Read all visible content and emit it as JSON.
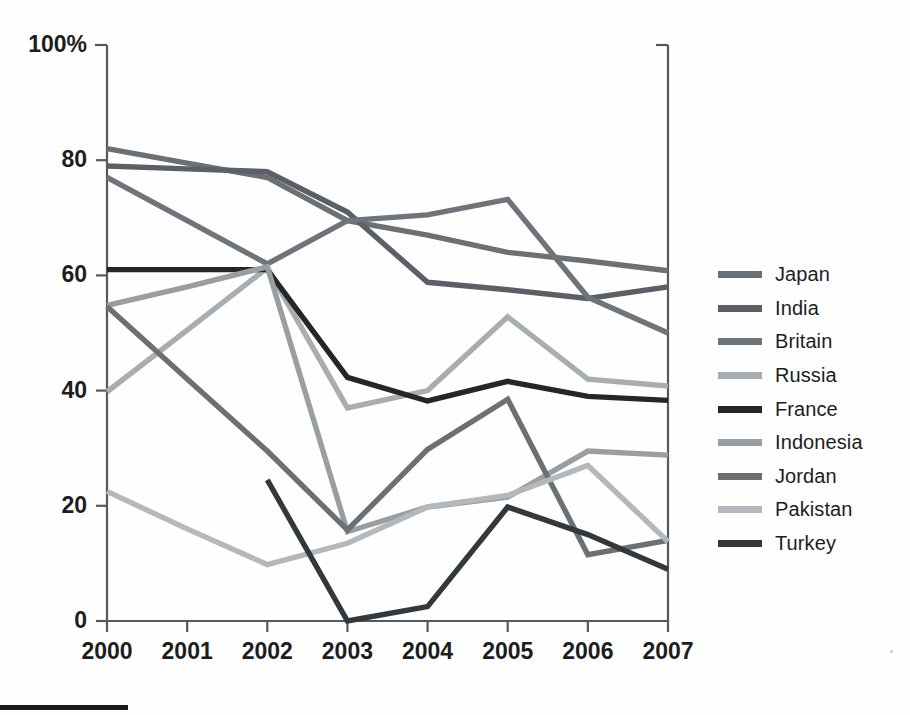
{
  "chart_data": {
    "type": "line",
    "title": "",
    "subtitle": "",
    "xlabel": "",
    "ylabel": "",
    "x": [
      "2000",
      "2001",
      "2002",
      "2003",
      "2004",
      "2005",
      "2006",
      "2007"
    ],
    "xlim": [
      2000,
      2007
    ],
    "ylim": [
      0,
      100
    ],
    "yticks": [
      0,
      20,
      40,
      60,
      80,
      100
    ],
    "ytick_labels": [
      "0",
      "20",
      "40",
      "60",
      "80",
      "100%"
    ],
    "xtick_labels": [
      "2000",
      "2001",
      "2002",
      "2003",
      "2004",
      "2005",
      "2006",
      "2007"
    ],
    "grid": false,
    "legend_position": "right",
    "series": [
      {
        "name": "Japan",
        "color": "#6b7075",
        "values": [
          82,
          79.5,
          77,
          69.5,
          67,
          64,
          62.5,
          60.8
        ]
      },
      {
        "name": "India",
        "color": "#5a6066",
        "values": [
          79,
          78.5,
          78,
          71,
          58.8,
          57.5,
          56,
          58
        ]
      },
      {
        "name": "Britain",
        "color": "#6e7479",
        "values": [
          77,
          69.5,
          62,
          69.5,
          70.5,
          73.2,
          56.2,
          50
        ]
      },
      {
        "name": "Russia",
        "color": "#a8adb1",
        "values": [
          39.8,
          50.5,
          61.3,
          37,
          40,
          52.8,
          42,
          40.8
        ]
      },
      {
        "name": "France",
        "color": "#262626",
        "values": [
          61,
          61,
          61,
          42.3,
          38.2,
          41.6,
          39,
          38.3
        ]
      },
      {
        "name": "Indonesia",
        "color": "#999ea2",
        "values": [
          54.8,
          58,
          61.5,
          15.5,
          19.8,
          21.5,
          29.5,
          28.8
        ]
      },
      {
        "name": "Jordan",
        "color": "#6b7075",
        "values": [
          54.6,
          42,
          29.5,
          15.8,
          29.8,
          38.5,
          11.5,
          14
        ]
      },
      {
        "name": "Pakistan",
        "color": "#b3b8bc",
        "values": [
          22.5,
          16,
          9.8,
          13.5,
          19.8,
          21.8,
          27,
          13.8
        ]
      },
      {
        "name": "Turkey",
        "color": "#33383c",
        "values": [
          null,
          null,
          24.5,
          0,
          2.5,
          19.8,
          15,
          9
        ]
      }
    ],
    "legend": [
      {
        "label": "Japan",
        "color": "#6b7075"
      },
      {
        "label": "India",
        "color": "#5a6066"
      },
      {
        "label": "Britain",
        "color": "#6e7479"
      },
      {
        "label": "Russia",
        "color": "#a8adb1"
      },
      {
        "label": "France",
        "color": "#262626"
      },
      {
        "label": "Indonesia",
        "color": "#999ea2"
      },
      {
        "label": "Jordan",
        "color": "#6b7075"
      },
      {
        "label": "Pakistan",
        "color": "#b3b8bc"
      },
      {
        "label": "Turkey",
        "color": "#33383c"
      }
    ],
    "axis_color": "#555a5e",
    "background": "#ffffff"
  }
}
